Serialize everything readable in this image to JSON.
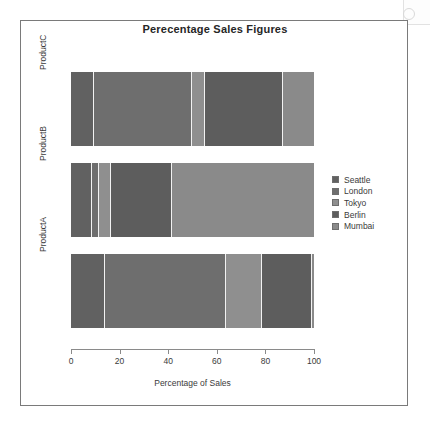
{
  "chart_data": {
    "type": "bar",
    "orientation": "horizontal",
    "stacked": true,
    "normalized": true,
    "title": "Perecentage Sales Figures",
    "xlabel": "Percentage of Sales",
    "ylabel": "",
    "xlim": [
      0,
      100
    ],
    "xticks": [
      0,
      20,
      40,
      60,
      80,
      100
    ],
    "xticklabels": [
      "0",
      "20",
      "40",
      "60",
      "80",
      "100"
    ],
    "categories": [
      "ProductA",
      "ProductB",
      "ProductC"
    ],
    "category_order_top_to_bottom": [
      "ProductC",
      "ProductB",
      "ProductA"
    ],
    "grid": false,
    "legend_position": "right",
    "series": [
      {
        "name": "Seattle",
        "color": "#616161",
        "values": [
          14.0,
          8.6,
          9.5
        ]
      },
      {
        "name": "London",
        "color": "#6e6e6e",
        "values": [
          49.8,
          2.9,
          40.3
        ]
      },
      {
        "name": "Tokyo",
        "color": "#8f8f8f",
        "values": [
          14.8,
          4.9,
          5.3
        ]
      },
      {
        "name": "Berlin",
        "color": "#5d5d5d",
        "values": [
          20.6,
          25.1,
          32.1
        ]
      },
      {
        "name": "Mumbai",
        "color": "#8a8a8a",
        "values": [
          0.8,
          58.5,
          12.8
        ]
      }
    ]
  },
  "legend": {
    "entries": [
      {
        "label": "Seattle",
        "color": "#616161"
      },
      {
        "label": "London",
        "color": "#6e6e6e"
      },
      {
        "label": "Tokyo",
        "color": "#8f8f8f"
      },
      {
        "label": "Berlin",
        "color": "#5d5d5d"
      },
      {
        "label": "Mumbai",
        "color": "#8a8a8a"
      }
    ]
  }
}
